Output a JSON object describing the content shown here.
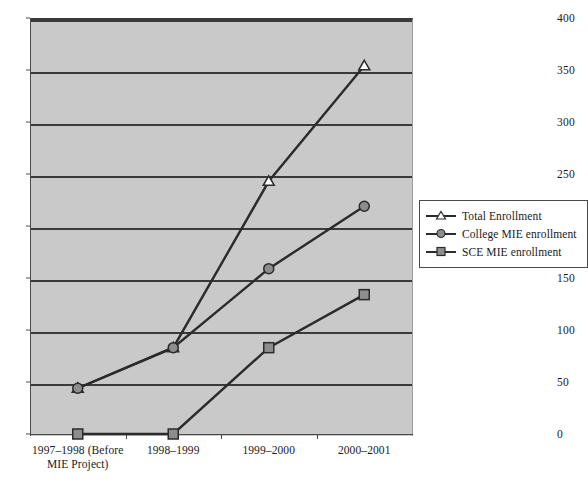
{
  "chart_data": {
    "type": "line",
    "title": "",
    "xlabel": "",
    "ylabel": "",
    "categories": [
      "1997–1998 (Before\nMIE Project)",
      "1998–1999",
      "1999–2000",
      "2000–2001"
    ],
    "series": [
      {
        "name": "Total Enrollment",
        "marker": "triangle",
        "values": [
          44,
          83,
          243,
          354
        ]
      },
      {
        "name": "College MIE enrollment",
        "marker": "circle",
        "values": [
          44,
          83,
          159,
          219
        ]
      },
      {
        "name": "SCE MIE enrollment",
        "marker": "square",
        "values": [
          0,
          0,
          83,
          134
        ]
      }
    ],
    "ylim": [
      0,
      400
    ],
    "yticks": [
      0,
      50,
      100,
      150,
      200,
      250,
      300,
      350,
      400
    ],
    "ytick_labels": [
      "0",
      "50",
      "100",
      "150",
      "200",
      "250",
      "300",
      "350",
      "400"
    ],
    "grid": true,
    "legend_position": "right",
    "plot_background": "#c9c9c9",
    "line_color": "#2b2b2b",
    "marker_fill": "#8d8d8d",
    "marker_fill_open": "#ffffff"
  },
  "legend": {
    "items": [
      {
        "label": "Total Enrollment"
      },
      {
        "label": "College MIE enrollment"
      },
      {
        "label": "SCE MIE enrollment"
      }
    ]
  },
  "caption": ""
}
